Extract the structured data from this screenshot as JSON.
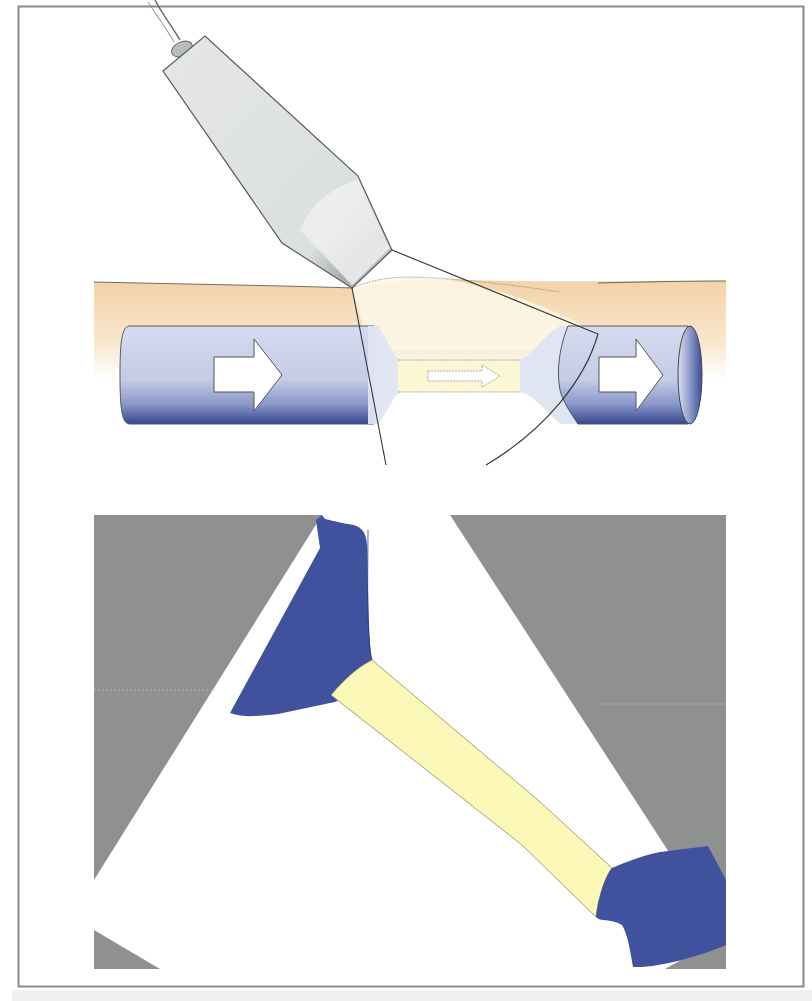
{
  "figure": {
    "colors": {
      "frame_border": "#8a8a8a",
      "skin_tissue": "#f6dcb8",
      "vessel_blue_light": "#c9d1ea",
      "vessel_blue_dark": "#3e4f9a",
      "stenosis_yellow": "#fbf7d2",
      "probe_gray": "#dfe1e2",
      "us_background_gray": "#8e8f8f",
      "doppler_blue": "#41529f",
      "doppler_yellow": "#fbf8b6"
    },
    "panels": [
      {
        "name": "schematic-panel",
        "content": "Probe, skin layer, vessel with stenosis and flow arrows"
      },
      {
        "name": "ultrasound-view-panel",
        "content": "Sector image: vessel with narrowed segment"
      }
    ],
    "flow_arrows": [
      "large-arrow-left",
      "small-arrow-stenosis",
      "large-arrow-right"
    ]
  }
}
